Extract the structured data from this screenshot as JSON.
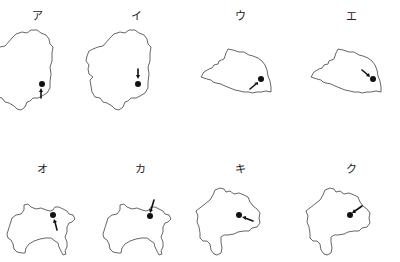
{
  "figure": {
    "panels": [
      {
        "id": "a",
        "label": "ア",
        "region": "tochigi-like outline",
        "arrow": "from below pointing up to dot"
      },
      {
        "id": "i",
        "label": "イ",
        "region": "tochigi-like outline",
        "arrow": "from above pointing down to dot"
      },
      {
        "id": "u",
        "label": "ウ",
        "region": "saitama-like outline",
        "arrow": "from lower-left pointing up-right to dot"
      },
      {
        "id": "e",
        "label": "エ",
        "region": "saitama-like outline",
        "arrow": "from upper-left pointing down-right to dot"
      },
      {
        "id": "o",
        "label": "オ",
        "region": "kanagawa-like outline",
        "arrow": "from below pointing up to dot"
      },
      {
        "id": "ka",
        "label": "カ",
        "region": "kanagawa-like outline",
        "arrow": "from above-right pointing down to dot"
      },
      {
        "id": "ki",
        "label": "キ",
        "region": "yamanashi-like outline",
        "arrow": "from lower-right pointing up-left to dot"
      },
      {
        "id": "ku",
        "label": "ク",
        "region": "yamanashi-like outline",
        "arrow": "from upper-right pointing down-left to dot"
      }
    ]
  },
  "colors": {
    "outline": "#555555",
    "marker": "#111111",
    "background": "#ffffff"
  }
}
